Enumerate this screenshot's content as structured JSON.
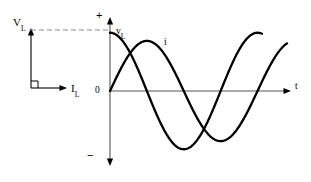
{
  "figure": {
    "background_color": "#ffffff",
    "stroke_color": "#000000",
    "dashed_color": "#888888"
  },
  "phasor_diagram": {
    "name": "phasor-axes",
    "voltage_axis_label": "V",
    "voltage_axis_subscript": "L",
    "current_axis_label": "I",
    "current_axis_subscript": "L",
    "right_angle_marker": true,
    "origin": [
      30,
      88
    ],
    "voltage_arrow_tip": [
      30,
      30
    ],
    "current_arrow_tip": [
      67,
      88
    ]
  },
  "waveform_plot": {
    "name": "waveform-axes",
    "time_axis_label": "t",
    "origin_label": "0",
    "positive_label": "+",
    "negative_label": "−",
    "axis": {
      "x_origin": 110,
      "y_origin": 91,
      "x_max": 290,
      "y_top": 18,
      "y_bottom": 166
    }
  },
  "chart_data": {
    "type": "line",
    "title": "",
    "xlabel": "t",
    "ylabel": "",
    "xlim": [
      0,
      1.22
    ],
    "ylim": [
      -1.25,
      1.25
    ],
    "grid": false,
    "legend": "inline-annotations",
    "annotations": [
      {
        "text": "v",
        "subscript": "L",
        "x": 0.04,
        "y": 1.02
      },
      {
        "text": "i",
        "subscript": "",
        "x": 0.37,
        "y": 0.72
      }
    ],
    "axis_ticks": {
      "x": [],
      "y": [
        {
          "label": "+",
          "value": 1.25
        },
        {
          "label": "0",
          "value": 0
        },
        {
          "label": "−",
          "value": -1.25
        }
      ]
    },
    "series": [
      {
        "name": "v_L",
        "label": "v",
        "subscript": "L",
        "waveform": "cosine",
        "amplitude": 1.0,
        "phase_deg": 0,
        "period": 1.0,
        "color": "#000000",
        "linewidth": 2.2,
        "x": [
          0.0,
          0.05,
          0.1,
          0.15,
          0.2,
          0.25,
          0.3,
          0.35,
          0.4,
          0.45,
          0.5,
          0.55,
          0.6,
          0.65,
          0.7,
          0.75,
          0.8,
          0.85,
          0.9,
          0.95,
          1.0,
          1.03
        ],
        "values": [
          1.0,
          0.95,
          0.81,
          0.59,
          0.31,
          0.0,
          -0.31,
          -0.59,
          -0.81,
          -0.95,
          -1.0,
          -0.95,
          -0.81,
          -0.59,
          -0.31,
          0.0,
          0.31,
          0.59,
          0.81,
          0.95,
          1.0,
          1.0
        ]
      },
      {
        "name": "i",
        "label": "i",
        "subscript": "",
        "waveform": "sine",
        "amplitude": 0.86,
        "phase_deg": -90,
        "period": 1.0,
        "color": "#000000",
        "linewidth": 2.2,
        "x": [
          0.0,
          0.05,
          0.1,
          0.15,
          0.2,
          0.25,
          0.3,
          0.35,
          0.4,
          0.45,
          0.5,
          0.55,
          0.6,
          0.65,
          0.7,
          0.75,
          0.8,
          0.85,
          0.9,
          0.95,
          1.0,
          1.05,
          1.1,
          1.15,
          1.2
        ],
        "values": [
          0.0,
          0.27,
          0.51,
          0.7,
          0.82,
          0.86,
          0.82,
          0.7,
          0.51,
          0.27,
          0.0,
          -0.27,
          -0.51,
          -0.7,
          -0.82,
          -0.86,
          -0.82,
          -0.7,
          -0.51,
          -0.27,
          0.0,
          0.27,
          0.51,
          0.7,
          0.82
        ]
      }
    ]
  },
  "dashed_reference_line": {
    "name": "peak-reference-line",
    "from": [
      31,
      30
    ],
    "to": [
      110,
      30
    ],
    "style": "dashed"
  }
}
